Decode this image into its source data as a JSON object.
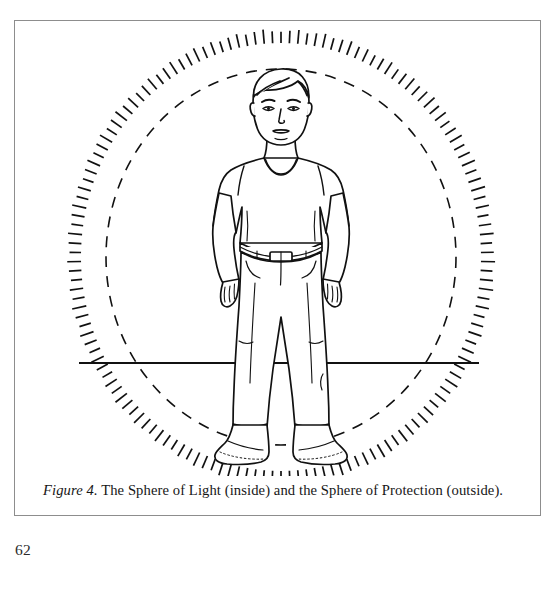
{
  "page": {
    "number": "62",
    "background_color": "#ffffff",
    "ink_color": "#111111",
    "frame_color": "#8d8d8d"
  },
  "figure": {
    "caption_label": "Figure 4.",
    "caption_text": " The Sphere of Light (inside) and the Sphere of Protection (outside).",
    "caption_full": "Figure 4. The Sphere of Light (inside) and the Sphere of Protection (outside).",
    "alt": "Line drawing of a standing man inside a dashed circle (Sphere of Light) surrounded by an outer ring of radial tick marks (Sphere of Protection), with a horizontal ground line through the middle.",
    "elements": {
      "inner_circle_name": "Sphere of Light",
      "inner_circle_style": "dashed",
      "outer_circle_name": "Sphere of Protection",
      "outer_circle_style": "radial tick marks",
      "ground_line_name": "horizon line",
      "subject_name": "standing man"
    },
    "geometry": {
      "center_x": 266,
      "center_y": 236,
      "inner_radius_x": 175,
      "inner_radius_y": 188,
      "outer_radius_x": 200,
      "outer_radius_y": 214,
      "tick_count": 150,
      "tick_length": 13,
      "ground_line_y": 342,
      "ground_line_x1": 64,
      "ground_line_x2": 464
    }
  }
}
